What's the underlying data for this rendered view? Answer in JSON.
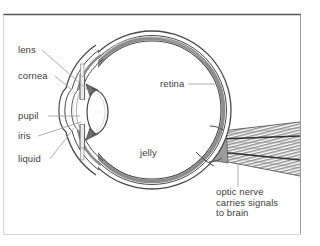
{
  "figure": {
    "type": "anatomical-diagram",
    "view": "horizontal cross-section, front of eye at left",
    "background_color": "#ffffff",
    "line_color": "#4a4a4a",
    "shade_color": "#8c8c8c",
    "text_color": "#3d3d3d",
    "frame": {
      "visible": true,
      "color": "#9a9a9a",
      "left": 3,
      "top": 14,
      "right": 301,
      "bottom": 235
    },
    "top_rule": {
      "visible": true,
      "color": "#555555",
      "y": 14
    },
    "watermark": {
      "visible": true,
      "text": "",
      "color": "#f2f2f2"
    }
  },
  "labels": {
    "lens": {
      "text": "lens",
      "x": 18,
      "y": 45,
      "leader": "diagonal-down-right"
    },
    "cornea": {
      "text": "cornea",
      "x": 18,
      "y": 71,
      "leader": "diagonal-down-right"
    },
    "pupil": {
      "text": "pupil",
      "x": 18,
      "y": 113,
      "leader": "horizontal-right"
    },
    "iris": {
      "text": "iris",
      "x": 18,
      "y": 133,
      "leader": "diagonal-up-right"
    },
    "liquid": {
      "text": "liquid",
      "x": 18,
      "y": 158,
      "leader": "diagonal-up-right"
    },
    "retina": {
      "text": "retina",
      "x": 160,
      "y": 80,
      "leader": "horizontal-right"
    },
    "jelly": {
      "text": "jelly",
      "x": 140,
      "y": 150,
      "leader": "none"
    },
    "optic_nerve": {
      "text": "optic nerve\ncarries signals\nto brain",
      "x": 216,
      "y": 188,
      "leader": "vertical-up"
    }
  },
  "anatomy": {
    "globe": {
      "label": "eyeball wall",
      "cx": 152,
      "cy": 110,
      "r": 78
    },
    "retina_band": {
      "label": "retina layer",
      "shaded": true,
      "color": "#8c8c8c"
    },
    "vitreous": {
      "label": "jelly (vitreous humour)"
    },
    "lens": {
      "label": "lens",
      "cx": 88,
      "cy": 113,
      "rx": 13,
      "ry": 24
    },
    "iris": {
      "label": "iris"
    },
    "pupil": {
      "label": "pupil"
    },
    "cornea": {
      "label": "cornea"
    },
    "aqueous": {
      "label": "liquid (aqueous humour)"
    },
    "optic_nerve": {
      "label": "optic nerve",
      "hatched": true,
      "color": "#8c8c8c"
    }
  }
}
